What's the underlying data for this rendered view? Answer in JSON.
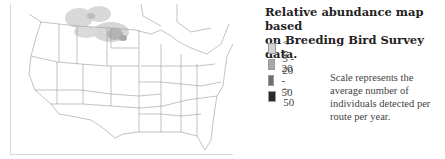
{
  "map": {
    "region": "Contiguous United States and southern Canada",
    "abundance_area": "Northern Great Plains (Montana, North Dakota, southern Saskatchewan/Manitoba)"
  },
  "title": {
    "line1": "Relative abundance map based",
    "line2": "on Breeding Bird Survey data."
  },
  "legend": {
    "items": [
      {
        "label": "< 5",
        "color": "#d2d2d2"
      },
      {
        "label": "5 - 20",
        "color": "#a8a8a8"
      },
      {
        "label": "20 - 50",
        "color": "#707070"
      },
      {
        "label": "> 50",
        "color": "#2a2a2a"
      }
    ]
  },
  "note": "Scale represents the average number of individuals detected per route per year."
}
